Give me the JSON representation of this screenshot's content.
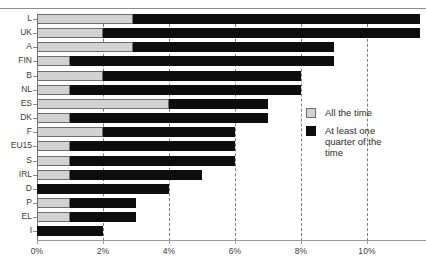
{
  "chart_data": {
    "type": "bar",
    "orientation": "horizontal",
    "stacked": true,
    "title": "",
    "subtitle": "",
    "xlabel": "",
    "ylabel": "",
    "xlim": [
      0,
      11.8
    ],
    "ylim": null,
    "grid": "vertical-dashed",
    "legend_position": "right",
    "xticks": [
      "0%",
      "2%",
      "4%",
      "6%",
      "8%",
      "10%"
    ],
    "xtick_values": [
      0,
      2,
      4,
      6,
      8,
      10
    ],
    "categories": [
      "L",
      "UK",
      "A",
      "FIN",
      "B",
      "NL",
      "ES",
      "DK",
      "F",
      "EU15",
      "S",
      "IRL",
      "D",
      "P",
      "EL",
      "I"
    ],
    "series": [
      {
        "name": "All the time",
        "color": "#d2d2d2",
        "values": [
          2.9,
          2.0,
          2.9,
          1.0,
          2.0,
          1.0,
          4.0,
          1.0,
          2.0,
          1.0,
          1.0,
          1.0,
          0.0,
          1.0,
          1.0,
          0.0
        ]
      },
      {
        "name": "At least one quarter of the time",
        "color": "#0d0d0d",
        "values": [
          8.7,
          9.6,
          6.1,
          8.0,
          6.0,
          7.0,
          3.0,
          6.0,
          4.0,
          5.0,
          5.0,
          4.0,
          4.0,
          2.0,
          2.0,
          2.0
        ]
      }
    ],
    "totals": [
      11.6,
      11.6,
      9.0,
      9.0,
      8.0,
      8.0,
      7.0,
      7.0,
      6.0,
      6.0,
      6.0,
      5.0,
      4.0,
      3.0,
      3.0,
      2.0
    ]
  },
  "legend": {
    "items": [
      {
        "label": "All the time",
        "swatch": "gray"
      },
      {
        "label": "At least one quarter of the time",
        "swatch": "black"
      }
    ]
  },
  "colors": {
    "all_the_time": "#d2d2d2",
    "at_least_one_quarter": "#0d0d0d",
    "axis": "#8a8a8a",
    "grid": "#7d7d7d",
    "text": "#3b3b3b"
  }
}
